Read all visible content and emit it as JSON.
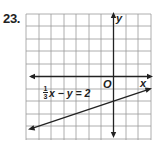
{
  "problem": {
    "number": "23."
  },
  "graph": {
    "x_axis_label": "x",
    "y_axis_label": "y",
    "origin_label": "O",
    "grid_color": "#9a9a9a",
    "axis_color": "#222222",
    "line_color": "#222222"
  },
  "equation": {
    "numerator": "1",
    "denominator": "3",
    "rest": "x − y = 2",
    "slope": "1/3",
    "y_intercept": -2
  }
}
